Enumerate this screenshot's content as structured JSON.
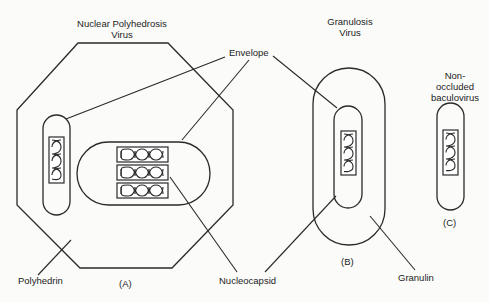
{
  "diagram": {
    "title_npv": [
      "Nuclear Polyhedrosis",
      "Virus"
    ],
    "title_gv": [
      "Granulosis",
      "Virus"
    ],
    "title_nob": [
      "Non-",
      "occluded",
      "baculovirus"
    ],
    "labels": {
      "envelope": "Envelope",
      "nucleocapsid": "Nucleocapsid",
      "polyhedrin": "Polyhedrin",
      "granulin": "Granulin",
      "panel_a": "(A)",
      "panel_b": "(B)",
      "panel_c": "(C)"
    },
    "colors": {
      "line": "#2a2a2a",
      "background": "#fbfbf9",
      "text": "#1c1c1c"
    }
  }
}
